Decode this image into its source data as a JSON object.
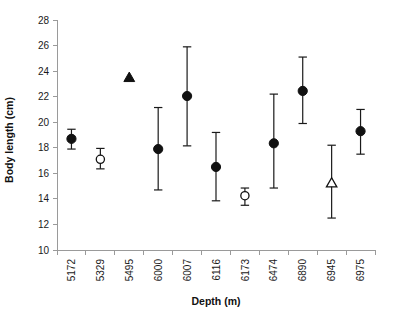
{
  "chart_data": {
    "type": "scatter",
    "title": "",
    "xlabel": "Depth (m)",
    "ylabel": "Body length (cm)",
    "ylim": [
      10,
      28
    ],
    "yticks": [
      10,
      12,
      14,
      16,
      18,
      20,
      22,
      24,
      26,
      28
    ],
    "ytick_labels": [
      "10",
      "12",
      "14",
      "16",
      "18",
      "20",
      "22",
      "24",
      "26",
      "28"
    ],
    "grid": false,
    "legend": "none",
    "categories": [
      "5172",
      "5329",
      "5495",
      "6000",
      "6007",
      "6116",
      "6173",
      "6474",
      "6890",
      "6945",
      "6975"
    ],
    "values": [
      18.7,
      17.1,
      23.5,
      17.9,
      22.05,
      16.5,
      14.25,
      18.35,
      22.45,
      15.25,
      19.3
    ],
    "error_low": [
      17.9,
      16.35,
      null,
      14.7,
      18.15,
      13.85,
      13.5,
      14.85,
      19.9,
      12.5,
      17.5
    ],
    "error_high": [
      19.45,
      17.95,
      null,
      21.15,
      25.9,
      19.2,
      14.85,
      22.2,
      25.1,
      18.2,
      21.0
    ],
    "series": [
      {
        "name": "measurements",
        "points": [
          {
            "x": "5172",
            "y": 18.7,
            "low": 17.9,
            "high": 19.45,
            "marker": "filled-circle"
          },
          {
            "x": "5329",
            "y": 17.1,
            "low": 16.35,
            "high": 17.95,
            "marker": "open-circle"
          },
          {
            "x": "5495",
            "y": 23.5,
            "low": null,
            "high": null,
            "marker": "filled-triangle"
          },
          {
            "x": "6000",
            "y": 17.9,
            "low": 14.7,
            "high": 21.15,
            "marker": "filled-circle"
          },
          {
            "x": "6007",
            "y": 22.05,
            "low": 18.15,
            "high": 25.9,
            "marker": "filled-circle"
          },
          {
            "x": "6116",
            "y": 16.5,
            "low": 13.85,
            "high": 19.2,
            "marker": "filled-circle"
          },
          {
            "x": "6173",
            "y": 14.25,
            "low": 13.5,
            "high": 14.85,
            "marker": "open-circle"
          },
          {
            "x": "6474",
            "y": 18.35,
            "low": 14.85,
            "high": 22.2,
            "marker": "filled-circle"
          },
          {
            "x": "6890",
            "y": 22.45,
            "low": 19.9,
            "high": 25.1,
            "marker": "filled-circle"
          },
          {
            "x": "6945",
            "y": 15.25,
            "low": 12.5,
            "high": 18.2,
            "marker": "open-triangle"
          },
          {
            "x": "6975",
            "y": 19.3,
            "low": 17.5,
            "high": 21.0,
            "marker": "filled-circle"
          }
        ]
      }
    ],
    "colors": {
      "marker": "#111111",
      "marker_open_fill": "#ffffff",
      "errorbar": "#1a1a1a",
      "axis": "#9a9a9a",
      "text": "#111111",
      "background": "#ffffff"
    }
  }
}
